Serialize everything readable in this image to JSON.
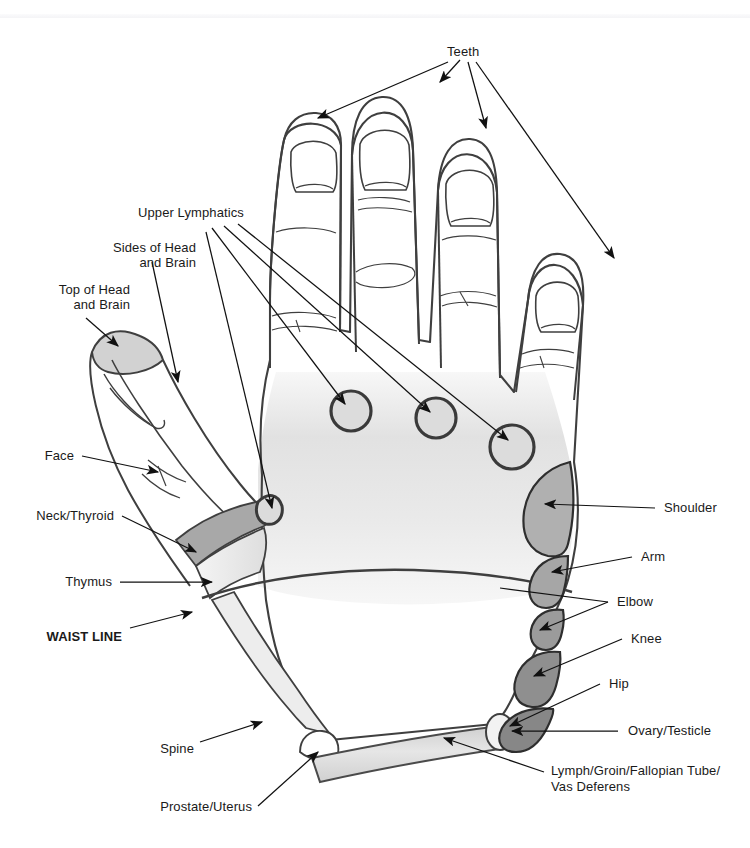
{
  "page": {
    "width": 750,
    "height": 848,
    "background": "#ffffff",
    "faint_header_text": "        "
  },
  "colors": {
    "ink": "#3a3a3a",
    "text": "#1a1a1a",
    "leader": "#111111",
    "palm_shade": "#e3e3e3",
    "top_head": "#d2d2d2",
    "neck_thyroid": "#a8a8a8",
    "thymus": "#e0e0e0",
    "shoulder": "#b0b0b0",
    "arm": "#a6a6a6",
    "elbow": "#9b9b9b",
    "knee": "#8f8f8f",
    "hip": "#878787",
    "ovary": "#f0f0f0",
    "lymph_band": "#dcdcdc",
    "spine": "#ededed",
    "lymphatic_circle": "#d8d8d8"
  },
  "labels": {
    "teeth": "Teeth",
    "upper_lymphatics": "Upper Lymphatics",
    "sides_of_head_line1": "Sides of Head",
    "sides_of_head_line2": "and Brain",
    "top_of_head_line1": "Top of Head",
    "top_of_head_line2": "and Brain",
    "face": "Face",
    "neck_thyroid": "Neck/Thyroid",
    "thymus": "Thymus",
    "waist_line": "WAIST LINE",
    "spine": "Spine",
    "prostate_uterus": "Prostate/Uterus",
    "shoulder": "Shoulder",
    "arm": "Arm",
    "elbow": "Elbow",
    "knee": "Knee",
    "hip": "Hip",
    "ovary_testicle": "Ovary/Testicle",
    "lymph_groin_line1": "Lymph/Groin/Fallopian Tube/",
    "lymph_groin_line2": "Vas Deferens"
  },
  "reflex_zones": [
    {
      "name": "Teeth",
      "region": "fingertips",
      "shade": "none"
    },
    {
      "name": "Upper Lymphatics",
      "region": "finger-web-circles",
      "shade": "#d8d8d8"
    },
    {
      "name": "Sides of Head and Brain",
      "region": "thumb-side",
      "shade": "none"
    },
    {
      "name": "Top of Head and Brain",
      "region": "thumb-tip",
      "shade": "#d2d2d2"
    },
    {
      "name": "Face",
      "region": "thumb-front",
      "shade": "none"
    },
    {
      "name": "Neck/Thyroid",
      "region": "thumb-base-band",
      "shade": "#a8a8a8"
    },
    {
      "name": "Thymus",
      "region": "thenar",
      "shade": "#e0e0e0"
    },
    {
      "name": "WAIST LINE",
      "region": "mid-palm-line",
      "shade": "none"
    },
    {
      "name": "Spine",
      "region": "thumb-edge",
      "shade": "#ededed"
    },
    {
      "name": "Prostate/Uterus",
      "region": "inner-wrist",
      "shade": "none"
    },
    {
      "name": "Shoulder",
      "region": "outer-edge-1",
      "shade": "#b0b0b0"
    },
    {
      "name": "Arm",
      "region": "outer-edge-2",
      "shade": "#a6a6a6"
    },
    {
      "name": "Elbow",
      "region": "outer-edge-3",
      "shade": "#9b9b9b"
    },
    {
      "name": "Knee",
      "region": "outer-edge-4",
      "shade": "#8f8f8f"
    },
    {
      "name": "Hip",
      "region": "outer-edge-5",
      "shade": "#878787"
    },
    {
      "name": "Ovary/Testicle",
      "region": "outer-wrist",
      "shade": "#f0f0f0"
    },
    {
      "name": "Lymph/Groin/Fallopian Tube/Vas Deferens",
      "region": "wrist-band",
      "shade": "#dcdcdc"
    }
  ]
}
